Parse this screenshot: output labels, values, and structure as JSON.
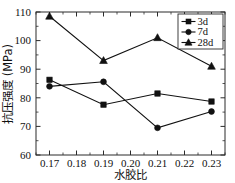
{
  "chart_data": {
    "type": "line",
    "title": "",
    "xlabel": "水胶比",
    "ylabel": "抗压强度 (MPa)",
    "xlim": [
      0.165,
      0.235
    ],
    "ylim": [
      60,
      110
    ],
    "x": [
      0.17,
      0.19,
      0.21,
      0.23
    ],
    "xticks": [
      "0.17",
      "0.18",
      "0.19",
      "0.20",
      "0.21",
      "0.22",
      "0.23"
    ],
    "xtick_values": [
      0.17,
      0.18,
      0.19,
      0.2,
      0.21,
      0.22,
      0.23
    ],
    "yticks": [
      "60",
      "70",
      "80",
      "90",
      "100",
      "110"
    ],
    "ytick_values": [
      60,
      70,
      80,
      90,
      100,
      110
    ],
    "grid": false,
    "legend_position": "top-right",
    "series": [
      {
        "name": "3d",
        "marker": "square",
        "color": "#111111",
        "values": [
          86.3,
          77.6,
          81.5,
          78.7
        ]
      },
      {
        "name": "7d",
        "marker": "circle",
        "color": "#111111",
        "values": [
          84.0,
          85.6,
          69.5,
          75.2
        ]
      },
      {
        "name": "28d",
        "marker": "triangle",
        "color": "#111111",
        "values": [
          108.5,
          93.0,
          101.0,
          91.0
        ]
      }
    ]
  },
  "axes": {
    "x_title": "水胶比",
    "y_title": "抗压强度 (MPa)"
  },
  "legend": {
    "items": [
      {
        "label": "3d"
      },
      {
        "label": "7d"
      },
      {
        "label": "28d"
      }
    ]
  }
}
